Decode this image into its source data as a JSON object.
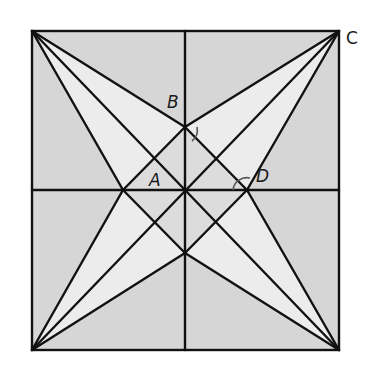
{
  "diagram": {
    "type": "geometry-figure",
    "colors": {
      "outer_fill": "#d6d6d6",
      "inner_fill": "#ececec",
      "stroke": "#111111",
      "angle_mark": "#555555"
    },
    "points": {
      "A": {
        "label": "A"
      },
      "B": {
        "label": "B"
      },
      "C": {
        "label": "C"
      },
      "D": {
        "label": "D"
      }
    },
    "angle_marks": [
      "angle at B",
      "angle at D"
    ]
  }
}
